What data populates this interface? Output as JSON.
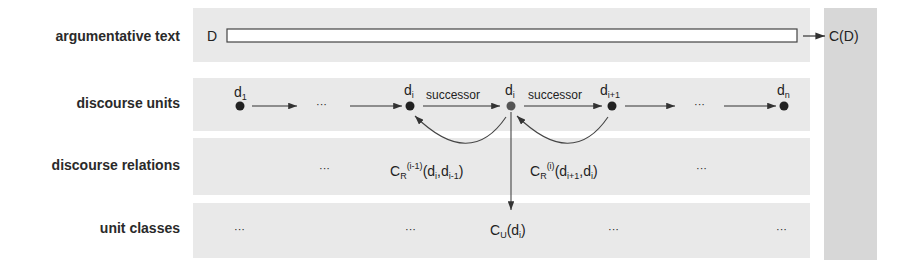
{
  "rows": [
    {
      "label": "argumentative text"
    },
    {
      "label": "discourse units"
    },
    {
      "label": "discourse relations"
    },
    {
      "label": "unit classes"
    }
  ],
  "text_row": {
    "doc_symbol": "D",
    "output": "C(D)"
  },
  "units": {
    "d1": {
      "base": "d",
      "sub": "1"
    },
    "di_prev": {
      "base": "d",
      "sub": "i"
    },
    "di": {
      "base": "d",
      "sub": "i"
    },
    "di_next": {
      "base": "d",
      "sub": "i+1"
    },
    "dn": {
      "base": "d",
      "sub": "n"
    },
    "ellipsis": "···",
    "successor": "successor"
  },
  "relations": {
    "left": {
      "base": "C",
      "sub": "R",
      "sup": "(i-1)",
      "args": "(d",
      "a1sub": "i",
      "mid": ",d",
      "a2sub": "i-1",
      "end": ")"
    },
    "right": {
      "base": "C",
      "sub": "R",
      "sup": "(i)",
      "args": "(d",
      "a1sub": "i+1",
      "mid": ",d",
      "a2sub": "i",
      "end": ")"
    },
    "ellipsis": "···"
  },
  "classes": {
    "cu": {
      "base": "C",
      "sub": "U",
      "args": "(d",
      "a1sub": "i",
      "end": ")"
    },
    "ellipsis": "···"
  }
}
